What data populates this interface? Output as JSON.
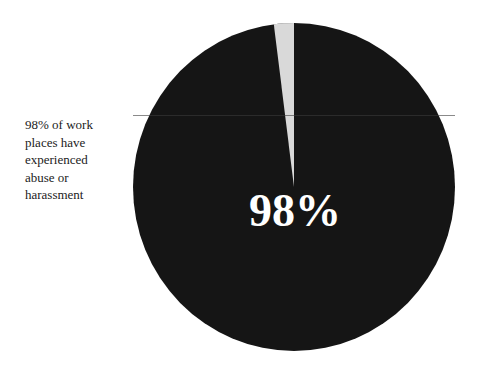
{
  "caption": "98% of work places have experienced abuse or harassment",
  "caption_lines": [
    "98% of work",
    "places have",
    "experienced",
    "abuse or",
    "harassment"
  ],
  "center_label": "98%",
  "colors": {
    "major": "#151515",
    "minor": "#d9d9d9",
    "text": "#222222"
  },
  "chart_data": {
    "type": "pie",
    "title": "",
    "categories": [
      "Experienced abuse or harassment",
      "Not experienced"
    ],
    "values": [
      98,
      2
    ],
    "unit": "%",
    "annotations": [
      "98%",
      "98% of work places have experienced abuse or harassment"
    ],
    "legend": "none"
  }
}
